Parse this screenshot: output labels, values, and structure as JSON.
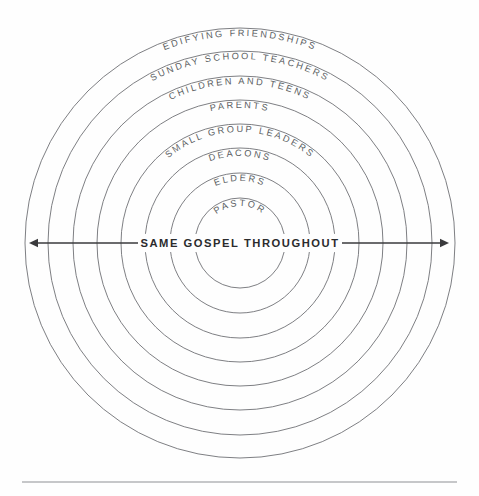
{
  "canvas": {
    "width": 479,
    "height": 496,
    "background": "#fefefe"
  },
  "diagram": {
    "type": "concentric-rings",
    "title_text": "SAME GOSPEL THROUGHOUT",
    "center_x": 240,
    "center_y": 243,
    "ring_stroke_color": "#6f7175",
    "ring_label_color": "#5c5e63",
    "axis_color": "#3a3a3c",
    "rule_color": "#8d8f93",
    "rings": [
      {
        "index": 0,
        "label": "PASTOR",
        "radius": 45,
        "label_radius": 37
      },
      {
        "index": 1,
        "label": "ELDERS",
        "radius": 70,
        "label_radius": 62
      },
      {
        "index": 2,
        "label": "DEACONS",
        "radius": 95,
        "label_radius": 87
      },
      {
        "index": 3,
        "label": "SMALL GROUP LEADERS",
        "radius": 119,
        "label_radius": 111
      },
      {
        "index": 4,
        "label": "PARENTS",
        "radius": 143,
        "label_radius": 135
      },
      {
        "index": 5,
        "label": "CHILDREN AND TEENS",
        "radius": 167,
        "label_radius": 159
      },
      {
        "index": 6,
        "label": "SUNDAY SCHOOL TEACHERS",
        "radius": 192,
        "label_radius": 184
      },
      {
        "index": 7,
        "label": "EDIFYING FRIENDSHIPS",
        "radius": 215,
        "label_radius": 207
      }
    ],
    "axis": {
      "label": "SAME GOSPEL THROUGHOUT",
      "y": 243,
      "x_start": 29,
      "x_end": 449,
      "left_arrow": "arrow-left",
      "right_arrow": "arrow-right"
    },
    "footer_rule": {
      "y": 482,
      "x_start": 22,
      "x_end": 457
    }
  }
}
